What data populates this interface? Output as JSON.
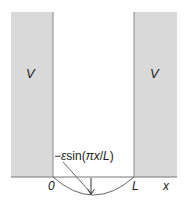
{
  "diagram": {
    "regions": [
      {
        "name": "left-barrier",
        "label": "V"
      },
      {
        "name": "right-barrier",
        "label": "V"
      }
    ],
    "axis": {
      "origin_label": "0",
      "well_width_label": "L",
      "axis_label": "x"
    },
    "perturbation": {
      "label_prefix": "−",
      "label_epsilon": "ε",
      "label_func": "sin(",
      "label_pi": "π",
      "label_x": "x",
      "label_slash": "/",
      "label_L": "L",
      "label_close": ")"
    },
    "colors": {
      "barrier_fill": "#d9d9d9",
      "barrier_edge": "#888888",
      "line": "#555555"
    }
  }
}
